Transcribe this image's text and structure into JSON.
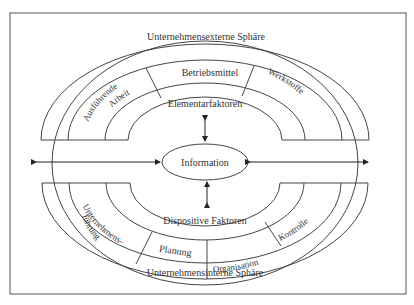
{
  "diagram": {
    "external_sphere": "Unternehmensexterne Sphäre",
    "internal_sphere": "Unternehmensinterne Sphäre",
    "center": "Information",
    "elementary": {
      "label": "Elementarfaktoren",
      "segments": [
        "Ausführende",
        "Arbeit",
        "Betriebsmittel",
        "Werkstoffe"
      ]
    },
    "dispositive": {
      "label": "Dispositive Faktoren",
      "segments": [
        "Unternehmens-",
        "führung",
        "Planung",
        "Organisation",
        "Kontrolle"
      ]
    },
    "colors": {
      "line": "#444444",
      "text": "#333333",
      "background": "#ffffff"
    }
  }
}
